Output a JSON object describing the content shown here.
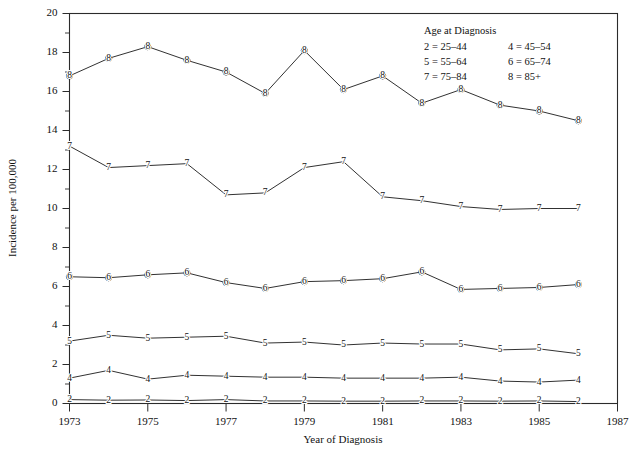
{
  "chart_data": {
    "type": "line",
    "title": "",
    "xlabel": "Year of Diagnosis",
    "ylabel": "Incidence per 100,000",
    "xlim": [
      1973,
      1987
    ],
    "ylim": [
      0,
      20
    ],
    "xticks": [
      1973,
      1975,
      1977,
      1979,
      1981,
      1983,
      1985,
      1987
    ],
    "xticklabels": [
      "1973",
      "1975",
      "1977",
      "1979",
      "1981",
      "1983",
      "1985",
      "1987"
    ],
    "yticks": [
      0,
      2,
      4,
      6,
      8,
      10,
      12,
      14,
      16,
      18,
      20
    ],
    "yticklabels": [
      "0",
      "2",
      "4",
      "6",
      "8",
      "10",
      "12",
      "14",
      "16",
      "18",
      "20"
    ],
    "minor_ytick_interval": 1,
    "grid": false,
    "legend_position": "top-right",
    "marker_style": "series-number-glyph",
    "x": [
      1973,
      1974,
      1975,
      1976,
      1977,
      1978,
      1979,
      1980,
      1981,
      1982,
      1983,
      1984,
      1985,
      1986
    ],
    "series": [
      {
        "name": "8",
        "label": "8 = 85+",
        "values": [
          16.8,
          17.7,
          18.3,
          17.6,
          17.0,
          15.9,
          18.1,
          16.1,
          16.8,
          15.4,
          16.1,
          15.3,
          15.0,
          14.5
        ]
      },
      {
        "name": "7",
        "label": "7 = 75-84",
        "values": [
          13.2,
          12.1,
          12.2,
          12.3,
          10.7,
          10.8,
          12.1,
          12.4,
          10.6,
          10.4,
          10.1,
          9.95,
          10.0,
          10.0
        ]
      },
      {
        "name": "6",
        "label": "6 = 65-74",
        "values": [
          6.5,
          6.45,
          6.6,
          6.7,
          6.2,
          5.9,
          6.25,
          6.3,
          6.4,
          6.75,
          5.85,
          5.9,
          5.95,
          6.1
        ]
      },
      {
        "name": "5",
        "label": "5 = 55-64",
        "values": [
          3.2,
          3.5,
          3.35,
          3.4,
          3.45,
          3.1,
          3.15,
          3.0,
          3.1,
          3.05,
          3.05,
          2.75,
          2.8,
          2.55
        ]
      },
      {
        "name": "4",
        "label": "4 = 45-54",
        "values": [
          1.3,
          1.7,
          1.25,
          1.45,
          1.4,
          1.35,
          1.35,
          1.3,
          1.3,
          1.3,
          1.35,
          1.15,
          1.1,
          1.2
        ]
      },
      {
        "name": "2",
        "label": "2 = 25-44",
        "values": [
          0.2,
          0.17,
          0.18,
          0.15,
          0.2,
          0.13,
          0.13,
          0.12,
          0.12,
          0.13,
          0.13,
          0.12,
          0.13,
          0.1
        ]
      }
    ]
  },
  "legend": {
    "title": "Age at Diagnosis",
    "rows": [
      {
        "left": "2 = 25–44",
        "right": "4 = 45–54"
      },
      {
        "left": "5 = 55–64",
        "right": "6 = 65–74"
      },
      {
        "left": "7 = 75–84",
        "right": "8 = 85+"
      }
    ]
  }
}
